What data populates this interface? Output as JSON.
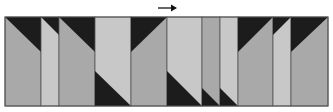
{
  "figure": {
    "type": "quilt-strip",
    "direction_arrow": "right",
    "colors": {
      "medium": "#a9a9a9",
      "light": "#c8c8c8",
      "dark": "#1c1c1c",
      "border": "#555555",
      "arrow": "#111111"
    },
    "strip": {
      "x": 5,
      "y": 17,
      "w": 323,
      "h": 89
    },
    "arrow": {
      "x1": 158,
      "y1": 8,
      "x2": 177,
      "y2": 8
    },
    "columns": [
      {
        "x0": 5,
        "x1": 41,
        "fill": "medium",
        "tri": [
          [
            5,
            17
          ],
          [
            41,
            17
          ],
          [
            41,
            52
          ]
        ]
      },
      {
        "x0": 41,
        "x1": 59,
        "fill": "light",
        "tri": [
          [
            41,
            17
          ],
          [
            59,
            17
          ],
          [
            59,
            35
          ]
        ]
      },
      {
        "x0": 59,
        "x1": 95,
        "fill": "medium",
        "tri": [
          [
            59,
            17
          ],
          [
            95,
            17
          ],
          [
            95,
            52
          ]
        ]
      },
      {
        "x0": 95,
        "x1": 131,
        "fill": "light",
        "tri": [
          [
            95,
            71
          ],
          [
            95,
            106
          ],
          [
            131,
            106
          ]
        ]
      },
      {
        "x0": 131,
        "x1": 167,
        "fill": "medium",
        "tri": [
          [
            131,
            17
          ],
          [
            167,
            17
          ],
          [
            131,
            52
          ]
        ]
      },
      {
        "x0": 167,
        "x1": 202,
        "fill": "light",
        "tri": [
          [
            167,
            71
          ],
          [
            167,
            106
          ],
          [
            202,
            106
          ]
        ]
      },
      {
        "x0": 202,
        "x1": 220,
        "fill": "medium",
        "tri": [
          [
            202,
            88
          ],
          [
            202,
            106
          ],
          [
            220,
            106
          ]
        ]
      },
      {
        "x0": 220,
        "x1": 238,
        "fill": "light",
        "tri": [
          [
            220,
            88
          ],
          [
            220,
            106
          ],
          [
            238,
            106
          ]
        ]
      },
      {
        "x0": 238,
        "x1": 273,
        "fill": "medium",
        "tri": [
          [
            238,
            17
          ],
          [
            273,
            17
          ],
          [
            238,
            52
          ]
        ]
      },
      {
        "x0": 273,
        "x1": 291,
        "fill": "light",
        "tri": [
          [
            273,
            17
          ],
          [
            291,
            17
          ],
          [
            273,
            35
          ]
        ]
      },
      {
        "x0": 291,
        "x1": 328,
        "fill": "medium",
        "tri": [
          [
            291,
            17
          ],
          [
            328,
            17
          ],
          [
            291,
            52
          ]
        ]
      }
    ]
  }
}
